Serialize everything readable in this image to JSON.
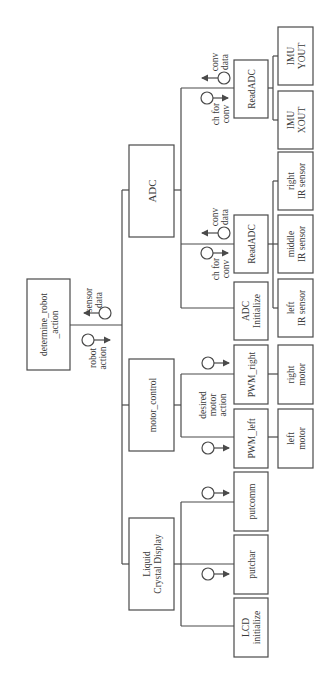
{
  "diagram": {
    "type": "structure-chart",
    "orientation": "rotated-90-ccw",
    "root": {
      "label_1": "determine_robot",
      "label_2": "_action"
    },
    "root_couples": [
      {
        "label_1": "sensor",
        "label_2": "data",
        "direction": "up"
      },
      {
        "label_1": "robot",
        "label_2": "action",
        "direction": "down"
      }
    ],
    "modules": {
      "adc": "ADC",
      "motor_control": "motor_control",
      "lcd": {
        "label_1": "Liquid",
        "label_2": "Crystal Display"
      }
    },
    "adc_children": {
      "readadc_top": "ReadADC",
      "readadc_mid": "ReadADC",
      "adc_init": {
        "label_1": "ADC",
        "label_2": "Initialize"
      },
      "couple_in": {
        "label_1": "ch for",
        "label_2": "conv"
      },
      "couple_out": {
        "label_1": "conv",
        "label_2": "data"
      }
    },
    "sensors": {
      "imu_yout": {
        "label_1": "IMU",
        "label_2": "YOUT"
      },
      "imu_xout": {
        "label_1": "IMU",
        "label_2": "XOUT"
      },
      "right_ir": {
        "label_1": "right",
        "label_2": "IR sensor"
      },
      "middle_ir": {
        "label_1": "middle",
        "label_2": "IR sensor"
      },
      "left_ir": {
        "label_1": "left",
        "label_2": "IR sensor"
      }
    },
    "motor_children": {
      "pwm_right": "PWM_right",
      "pwm_left": "PWM_left",
      "couple": {
        "label_1": "desired",
        "label_2": "motor",
        "label_3": "action"
      },
      "right_motor": {
        "label_1": "right",
        "label_2": "motor"
      },
      "left_motor": {
        "label_1": "left",
        "label_2": "motor"
      }
    },
    "lcd_children": {
      "putcomm": "putcomm",
      "putchar": "putchar",
      "lcd_init": {
        "label_1": "LCD",
        "label_2": "initialize"
      }
    }
  }
}
